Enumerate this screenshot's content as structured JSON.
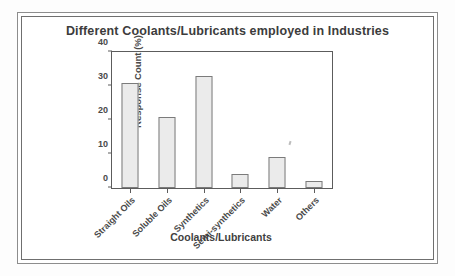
{
  "chart_data": {
    "type": "bar",
    "title": "Different Coolants/Lubricants employed in Industries",
    "xlabel": "Coolants/Lubricants",
    "ylabel": "Response Count (%)",
    "categories": [
      "Straight Oils",
      "Soluble Oils",
      "Synthetics",
      "Semi-synthetics",
      "Water",
      "Others"
    ],
    "values": [
      31,
      21,
      33,
      4,
      9,
      2
    ],
    "ylim": [
      0,
      40
    ],
    "yticks": [
      0,
      10,
      20,
      30,
      40
    ],
    "ytick_labels": [
      "0",
      "10",
      "20",
      "30",
      "40"
    ],
    "grid": false,
    "legend": false,
    "bar_color": "#ebebeb",
    "bar_edge_color": "#7b7b7b",
    "axis_color": "#5c5c5c",
    "text_color": "#4a4a4a"
  },
  "figure": {
    "frame_style": "double-line-border",
    "background": "#ffffff"
  }
}
